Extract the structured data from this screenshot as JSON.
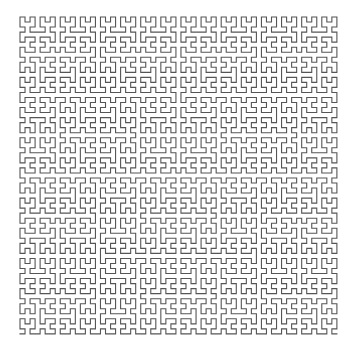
{
  "figure": {
    "type": "hilbert-curve",
    "order": 6,
    "grid_cells_per_side": 64,
    "start_corner": "bottom-left",
    "end_corner": "bottom-right",
    "origin_x": 20,
    "origin_y": 17,
    "step": 5.03,
    "stroke_color": "#555555",
    "stroke_width": 1.1,
    "background_color": "#ffffff"
  }
}
